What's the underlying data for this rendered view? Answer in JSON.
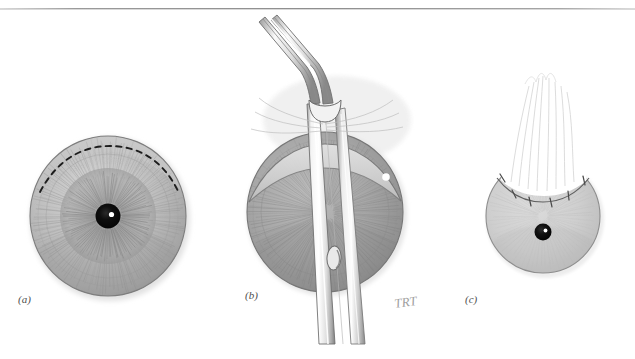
{
  "figure": {
    "medium": "pencil illustration",
    "background_color": "#ffffff",
    "artist_signature": "TRT",
    "page_edge_color": "#8e8e8e"
  },
  "panels": [
    {
      "id": "a",
      "label": "(a)",
      "caption_text": "(a)",
      "description": "Frontal view of eye globe with radial iris striations, dark pupil with white light reflex, and a dashed arc marking the planned superior conjunctival incision",
      "elements": {
        "globe_fill": "#b9b9b9",
        "iris_fill": "#a8a8a8",
        "pupil_fill": "#0d0d0d",
        "light_reflex": "#ffffff",
        "incision_line_style": "dashed",
        "incision_line_color": "#1c1c1c",
        "stipple_region": "superior conjunctiva"
      }
    },
    {
      "id": "b",
      "label": "(b)",
      "caption_text": "(b)",
      "description": "Angled tying forceps grasping and elevating the superior conjunctival flap off the globe; instrument shaft crosses the cornea vertically",
      "elements": {
        "instrument_name": "angled forceps",
        "instrument_fill": "#fbfbfb",
        "instrument_outline": "#6f6f6f",
        "fenestration_label": "shaft fenestration",
        "globe_fill": "#9f9f9f",
        "flap_fill": "#c9c9c9",
        "highlight_dot": "#ffffff"
      }
    },
    {
      "id": "c",
      "label": "(c)",
      "caption_text": "(c)",
      "description": "Completed graft: white autograft tissue sutured into the superior bare sclera defect with interrupted sutures",
      "elements": {
        "globe_fill": "#cfcfcf",
        "graft_fill": "#ffffff",
        "pupil_fill": "#111111",
        "light_reflex": "#ffffff",
        "suture_color": "#5a5a5a",
        "suture_count": 6
      }
    }
  ],
  "labels": {
    "a": "(a)",
    "b": "(b)",
    "c": "(c)",
    "signature": "TRT"
  }
}
